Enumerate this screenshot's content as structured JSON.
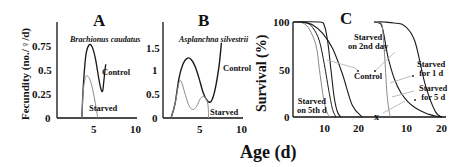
{
  "figure": {
    "xlabel": "Age (d)"
  },
  "colors": {
    "control": "#1a1a1a",
    "starved": "#8a8a8a",
    "axis": "#111111",
    "annotation_line": "#b5b5b5"
  },
  "chart_data": [
    {
      "panel": "A",
      "type": "line",
      "title": "Brachionus caudatus",
      "xlabel": "",
      "ylabel": "Fecundity (no./♀/d)",
      "xticks": [
        "5",
        "10"
      ],
      "yticks": [
        "0",
        "0.25",
        "0.5",
        "0.75"
      ],
      "xlim": [
        0,
        10
      ],
      "ylim": [
        0,
        0.95
      ],
      "grid": false,
      "series": [
        {
          "name": "Control",
          "x": [
            3.1,
            3.3,
            3.6,
            4.0,
            4.4,
            4.8,
            5.2,
            5.5,
            5.7,
            5.85,
            6.0,
            6.1
          ],
          "y": [
            0,
            0.35,
            0.65,
            0.76,
            0.74,
            0.62,
            0.42,
            0.3,
            0.28,
            0.38,
            0.5,
            0.56
          ]
        },
        {
          "name": "Starved",
          "x": [
            3.1,
            3.3,
            3.6,
            3.9,
            4.2,
            4.5,
            4.8,
            5.0,
            5.1
          ],
          "y": [
            0,
            0.3,
            0.43,
            0.43,
            0.38,
            0.28,
            0.15,
            0.05,
            0
          ]
        }
      ],
      "annotations": [
        "Control",
        "Starved"
      ]
    },
    {
      "panel": "B",
      "type": "line",
      "title": "Asplanchna silvestrii",
      "xlabel": "",
      "ylabel": "",
      "xticks": [
        "5",
        "10"
      ],
      "yticks": [
        "0",
        "0.5",
        "1",
        "1.5"
      ],
      "xlim": [
        0,
        10
      ],
      "ylim": [
        0,
        2.0
      ],
      "grid": false,
      "series": [
        {
          "name": "Control",
          "x": [
            1.0,
            1.5,
            2.0,
            2.5,
            3.0,
            3.5,
            4.0,
            4.5,
            5.0,
            5.5,
            6.0,
            6.5,
            7.0,
            7.3
          ],
          "y": [
            0,
            0.3,
            0.85,
            1.15,
            1.27,
            1.25,
            1.1,
            0.85,
            0.55,
            0.38,
            0.35,
            0.6,
            1.1,
            1.6
          ]
        },
        {
          "name": "Starved",
          "x": [
            1.0,
            1.5,
            2.0,
            2.3,
            2.7,
            3.2,
            3.7,
            4.2,
            4.7,
            5.2,
            5.6,
            5.7
          ],
          "y": [
            0,
            0.3,
            0.75,
            0.77,
            0.55,
            0.28,
            0.18,
            0.25,
            0.42,
            0.45,
            0.3,
            0
          ]
        }
      ],
      "annotations": [
        "Control",
        "Starved"
      ]
    },
    {
      "panel": "C",
      "type": "line",
      "title": "",
      "xlabel": "",
      "ylabel": "Survival (%)",
      "xticks": [
        "10",
        "20",
        "10",
        "20"
      ],
      "yticks": [
        "0",
        "50",
        "100"
      ],
      "ylim": [
        0,
        100
      ],
      "axis_break": true,
      "grid": false,
      "left_segment": {
        "xlim": [
          0,
          23
        ],
        "series": [
          {
            "name": "Control",
            "x": [
              0,
              3,
              6,
              9,
              12,
              15,
              18,
              21
            ],
            "y": [
              100,
              100,
              97,
              88,
              72,
              45,
              12,
              0
            ]
          },
          {
            "name": "Starved on 2nd day",
            "x": [
              0,
              8,
              9.5,
              10.5,
              11.5,
              12.5,
              13.5,
              14.5
            ],
            "y": [
              100,
              100,
              96,
              80,
              50,
              20,
              5,
              0
            ]
          },
          {
            "name": "Starved on 5th d",
            "x": [
              0,
              3,
              5,
              7,
              8,
              9,
              10,
              11
            ],
            "y": [
              100,
              99,
              92,
              75,
              50,
              25,
              8,
              0
            ]
          },
          {
            "name": "Starved on 5th d (b)",
            "x": [
              0,
              4,
              6,
              8,
              9.5,
              11,
              12,
              13
            ],
            "y": [
              100,
              99,
              94,
              80,
              55,
              25,
              8,
              0
            ]
          }
        ]
      },
      "right_segment": {
        "xlim": [
          0,
          20
        ],
        "series": [
          {
            "name": "Control",
            "x": [
              0,
              3,
              6,
              9,
              12,
              15,
              18,
              20
            ],
            "y": [
              100,
              100,
              99,
              96,
              80,
              35,
              6,
              0
            ]
          },
          {
            "name": "Starved for 1 d",
            "x": [
              0,
              2,
              3,
              4,
              6,
              8,
              10,
              12,
              14,
              16,
              18,
              20
            ],
            "y": [
              100,
              98,
              85,
              65,
              40,
              25,
              16,
              10,
              6,
              3,
              1,
              0
            ]
          },
          {
            "name": "Starved for 5 d",
            "x": [
              0,
              2,
              2.6,
              3.2,
              3.8,
              4.5,
              5
            ],
            "y": [
              100,
              99,
              90,
              60,
              25,
              5,
              0
            ]
          }
        ]
      },
      "annotations": [
        "Starved on 2nd day",
        "Control",
        "Starved on 5th d",
        "Starved for 1 d",
        "Starved for 5 d"
      ]
    }
  ],
  "labels": {
    "A": {
      "letter": "A",
      "species": "Brachionus caudatus",
      "ylabel": "Fecundity (no./♀/d)",
      "yticks": [
        "0.75",
        "0.5",
        "0.25",
        "0"
      ],
      "xticks": [
        "5",
        "10"
      ],
      "control": "Control",
      "starved": "Starved"
    },
    "B": {
      "letter": "B",
      "species": "Asplanchna silvestrii",
      "yticks": [
        "1.5",
        "1",
        "0.5",
        "0"
      ],
      "xticks": [
        "5",
        "10"
      ],
      "control": "Control",
      "starved": "Starved"
    },
    "C": {
      "letter": "C",
      "ylabel": "Survival (%)",
      "yticks": [
        "100",
        "50",
        "0"
      ],
      "xticks": [
        "10",
        "20",
        "10",
        "20"
      ],
      "break_mark": "x",
      "ann_starved2_l1": "Starved",
      "ann_starved2_l2": "on 2nd day",
      "ann_control": "Control",
      "ann_starved5_l1": "Starved",
      "ann_starved5_l2": "on 5th d",
      "ann_for1_l1": "Starved",
      "ann_for1_l2": "for 1 d",
      "ann_for5_l1": "Starved",
      "ann_for5_l2": "for 5 d"
    }
  }
}
